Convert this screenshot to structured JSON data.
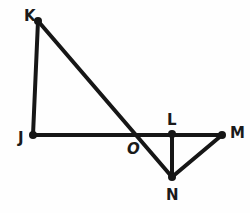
{
  "figure": {
    "type": "geometry-diagram",
    "width": 250,
    "height": 213,
    "background_color": "#fefefe",
    "stroke_color": "#161616",
    "stroke_width": 4,
    "dot_color": "#161616",
    "dot_radius": 4,
    "vertices": [
      {
        "id": "K",
        "label": "K",
        "x": 38,
        "y": 21,
        "label_x": 24,
        "label_y": 9,
        "dot": true,
        "italic": false
      },
      {
        "id": "J",
        "label": "J",
        "x": 33,
        "y": 135,
        "label_x": 18,
        "label_y": 131,
        "dot": true,
        "italic": false
      },
      {
        "id": "O",
        "label": "O",
        "x": 134,
        "y": 134,
        "label_x": 127,
        "label_y": 142,
        "dot": false,
        "italic": true
      },
      {
        "id": "L",
        "label": "L",
        "x": 172,
        "y": 134,
        "label_x": 167,
        "label_y": 113,
        "dot": true,
        "italic": false
      },
      {
        "id": "M",
        "label": "M",
        "x": 222,
        "y": 135,
        "label_x": 230,
        "label_y": 126,
        "dot": true,
        "italic": false
      },
      {
        "id": "N",
        "label": "N",
        "x": 172,
        "y": 177,
        "label_x": 166,
        "label_y": 188,
        "dot": true,
        "italic": false
      }
    ],
    "segments": [
      {
        "name": "segment-JK",
        "from": "J",
        "to": "K"
      },
      {
        "name": "segment-JM",
        "from": "J",
        "to": "M"
      },
      {
        "name": "segment-KN",
        "from": "K",
        "to": "N"
      },
      {
        "name": "segment-LN",
        "from": "L",
        "to": "N"
      },
      {
        "name": "segment-NM",
        "from": "N",
        "to": "M"
      }
    ]
  }
}
